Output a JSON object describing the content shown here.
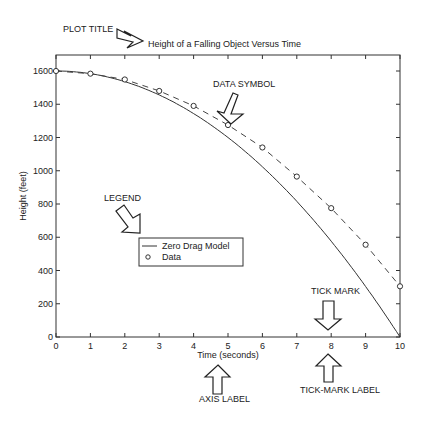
{
  "chart_data": {
    "type": "line",
    "title": "Height of a Falling Object Versus Time",
    "xlabel": "Time (seconds)",
    "ylabel": "Height (feet)",
    "xlim": [
      0,
      10
    ],
    "ylim": [
      0,
      1700
    ],
    "xticks": [
      0,
      1,
      2,
      3,
      4,
      5,
      6,
      7,
      8,
      9,
      10
    ],
    "yticks": [
      0,
      200,
      400,
      600,
      800,
      1000,
      1200,
      1400,
      1600
    ],
    "grid": false,
    "legend_position": "center-left",
    "series": [
      {
        "name": "Zero Drag Model",
        "style": "solid",
        "x": [
          0,
          1,
          2,
          3,
          4,
          5,
          6,
          7,
          8,
          9,
          10
        ],
        "values": [
          1600,
          1584,
          1536,
          1456,
          1344,
          1200,
          1024,
          816,
          576,
          304,
          0
        ]
      },
      {
        "name": "Data",
        "style": "circle-markers",
        "x": [
          0,
          1,
          2,
          3,
          4,
          5,
          6,
          7,
          8,
          9,
          10
        ],
        "values": [
          1600,
          1584,
          1549,
          1480,
          1390,
          1275,
          1140,
          965,
          775,
          555,
          305
        ]
      },
      {
        "name": "Data fit",
        "style": "dashed",
        "x": [
          0,
          1,
          2,
          3,
          4,
          5,
          6,
          7,
          8,
          9,
          10
        ],
        "values": [
          1600,
          1584,
          1549,
          1480,
          1390,
          1275,
          1140,
          965,
          775,
          555,
          305
        ]
      }
    ],
    "annotations": [
      "PLOT TITLE",
      "DATA SYMBOL",
      "LEGEND",
      "TICK MARK",
      "AXIS LABEL",
      "TICK-MARK LABEL"
    ]
  },
  "labels": {
    "title": "Height of a Falling Object Versus Time",
    "xlabel": "Time (seconds)",
    "ylabel": "Height (feet)",
    "legend_line": "Zero Drag Model",
    "legend_data": "Data",
    "ann_title": "PLOT TITLE",
    "ann_symbol": "DATA SYMBOL",
    "ann_legend": "LEGEND",
    "ann_tick": "TICK MARK",
    "ann_axis": "AXIS LABEL",
    "ann_ticklabel": "TICK-MARK LABEL"
  }
}
